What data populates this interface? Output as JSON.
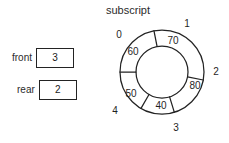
{
  "diagram": {
    "title": "subscript",
    "pointers": [
      {
        "name": "front",
        "label": "front",
        "value": "3"
      },
      {
        "name": "rear",
        "label": "rear",
        "value": "2"
      }
    ],
    "ring": {
      "outer_labels": [
        "0",
        "1",
        "2",
        "3",
        "4"
      ],
      "inner_values": [
        "60",
        "70",
        "80",
        "40",
        "50"
      ],
      "cells": [
        {
          "subscript": "0",
          "value": "60"
        },
        {
          "subscript": "1",
          "value": "70"
        },
        {
          "subscript": "2",
          "value": "80"
        },
        {
          "subscript": "3",
          "value": "40"
        },
        {
          "subscript": "4",
          "value": "50"
        }
      ]
    },
    "colors": {
      "stroke": "#232323",
      "text": "#1f1f1f",
      "background": "#ffffff"
    }
  }
}
